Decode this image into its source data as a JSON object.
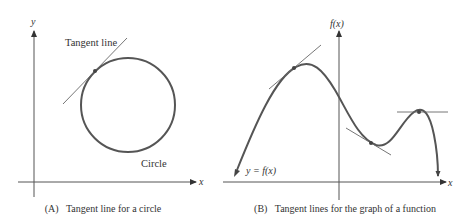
{
  "panel_a": {
    "caption": "(A)   Tangent line for a circle",
    "y_axis_label": "y",
    "x_axis_label": "x",
    "tangent_label": "Tangent line",
    "circle_label": "Circle"
  },
  "panel_b": {
    "caption": "(B)   Tangent lines for the graph of a function",
    "y_axis_label": "f(x)",
    "x_axis_label": "x",
    "curve_label": "y = f(x)"
  },
  "colors": {
    "axis": "#444444",
    "curve": "#555555",
    "tangent": "#666666",
    "text": "#333333"
  }
}
